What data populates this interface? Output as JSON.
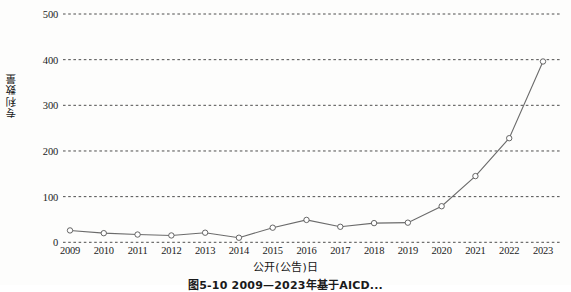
{
  "chart_data": {
    "type": "line",
    "title": "",
    "xlabel": "公开(公告)日",
    "ylabel": "专利数量",
    "categories": [
      "2009",
      "2010",
      "2011",
      "2012",
      "2013",
      "2014",
      "2015",
      "2016",
      "2017",
      "2018",
      "2019",
      "2020",
      "2021",
      "2022",
      "2023"
    ],
    "values": [
      26,
      20,
      17,
      15,
      21,
      10,
      32,
      49,
      34,
      42,
      43,
      79,
      145,
      228,
      396
    ],
    "series": [
      {
        "name": "专利数量",
        "values": [
          26,
          20,
          17,
          15,
          21,
          10,
          32,
          49,
          34,
          42,
          43,
          79,
          145,
          228,
          396
        ]
      }
    ],
    "ylim": [
      0,
      500
    ],
    "ytick_labels": [
      "0",
      "100",
      "200",
      "300",
      "400",
      "500"
    ],
    "ytick_values": [
      0,
      100,
      200,
      300,
      400,
      500
    ],
    "xtick_labels": [
      "2009",
      "2010",
      "2011",
      "2012",
      "2013",
      "2014",
      "2015",
      "2016",
      "2017",
      "2018",
      "2019",
      "2020",
      "2021",
      "2022",
      "2023"
    ],
    "grid": "horizontal-dashed",
    "legend": "none",
    "marker": "open-circle",
    "line_color": "#6b6b6b",
    "marker_edge_color": "#555555",
    "marker_face_color": "#ffffff",
    "grid_color": "#3a3a3a"
  },
  "caption": {
    "text": "图5-10  2009—2023年基于AICD..."
  }
}
